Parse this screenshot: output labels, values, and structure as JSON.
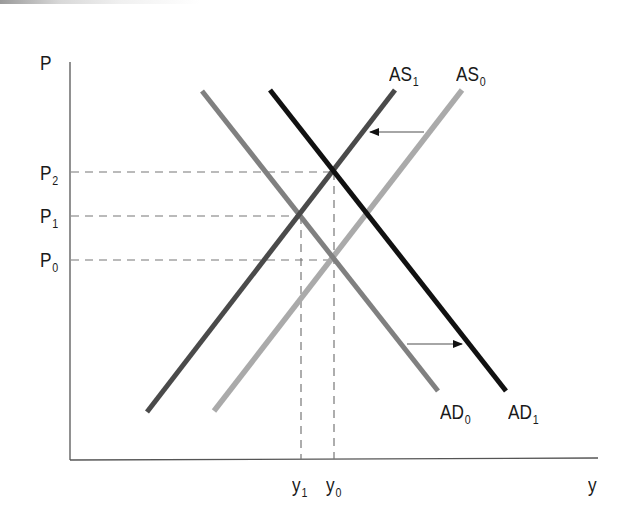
{
  "diagram": {
    "type": "AS-AD model",
    "axes": {
      "y_label": "P",
      "x_label": "y"
    },
    "price_levels": [
      {
        "base": "P",
        "sub": "2"
      },
      {
        "base": "P",
        "sub": "1"
      },
      {
        "base": "P",
        "sub": "0"
      }
    ],
    "output_levels": [
      {
        "base": "y",
        "sub": "1"
      },
      {
        "base": "y",
        "sub": "0"
      }
    ],
    "curves": [
      {
        "id": "AS1",
        "base": "AS",
        "sub": "1",
        "color": "#4a4a4a"
      },
      {
        "id": "AS0",
        "base": "AS",
        "sub": "0",
        "color": "#aaaaaa"
      },
      {
        "id": "AD0",
        "base": "AD",
        "sub": "0",
        "color": "#808080"
      },
      {
        "id": "AD1",
        "base": "AD",
        "sub": "1",
        "color": "#111111"
      }
    ],
    "shifts": [
      {
        "from": "AS0",
        "to": "AS1",
        "direction": "left"
      },
      {
        "from": "AD0",
        "to": "AD1",
        "direction": "right"
      }
    ]
  }
}
